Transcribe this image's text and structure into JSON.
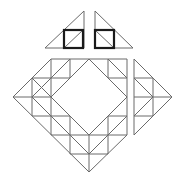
{
  "figure": {
    "colors": {
      "line": "#6a6a6a",
      "bold": "#1a1a1a",
      "background": "#ffffff"
    },
    "pieces": [
      {
        "name": "top-left-triangle",
        "has_bold_square": true
      },
      {
        "name": "top-right-triangle",
        "has_bold_square": true
      },
      {
        "name": "diamond-frame",
        "inner_hole": true
      },
      {
        "name": "right-triangle-piece"
      }
    ]
  }
}
